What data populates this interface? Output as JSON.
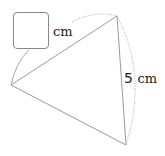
{
  "diagram": {
    "type": "triangle-with-arc-labels",
    "vertices": {
      "left": [
        11,
        85
      ],
      "top": [
        117,
        16
      ],
      "bottom": [
        126,
        145
      ]
    },
    "labels": {
      "unknown_side_unit": "cm",
      "known_side_value": "5",
      "known_side_unit": "cm"
    },
    "colors": {
      "line": "#9a9a9a",
      "arc": "#a8a8a8",
      "text": "#222222",
      "box_border": "#888888"
    }
  }
}
